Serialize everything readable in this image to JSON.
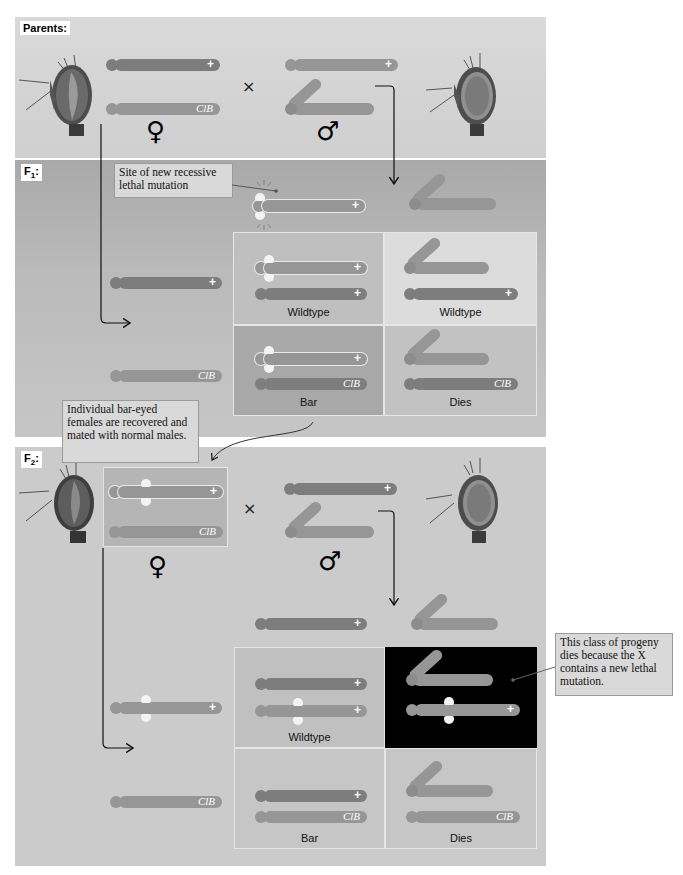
{
  "figure": {
    "colors": {
      "background": "#ffffff",
      "parents_panel": "#d4d4d4",
      "f1_panel": "#b3b3b3",
      "f2_panel": "#cbcbcb",
      "chromosome_dark": "#7d7d7d",
      "chromosome_light": "#969696",
      "dies_cell_background": "#000000",
      "callout_background": "#d9d9d9"
    }
  },
  "parents": {
    "label": "Parents:",
    "cross_symbol": "×",
    "female": {
      "symbol": "♀",
      "chromosomes": [
        {
          "allele_label": "+",
          "shade": "dark"
        },
        {
          "allele_label": "ClB",
          "shade": "light"
        }
      ]
    },
    "male": {
      "symbol": "♂",
      "chromosomes": [
        {
          "allele_label": "+",
          "shade": "light",
          "type": "X"
        },
        {
          "allele_label": "",
          "shade": "light",
          "type": "Y"
        }
      ]
    }
  },
  "f1": {
    "label": "F",
    "label_sub": "1",
    "label_suffix": ":",
    "callout": "Site of new recessive lethal mutation",
    "top_row": {
      "maternal_x": {
        "allele_label": "+",
        "has_mutation": true
      },
      "paternal": "Y"
    },
    "left_column": [
      {
        "allele_label": "+"
      },
      {
        "allele_label": "ClB"
      }
    ],
    "cells": [
      {
        "label": "Wildtype",
        "chromosomes": [
          "+ (mutant)",
          "+"
        ]
      },
      {
        "label": "Wildtype",
        "chromosomes": [
          "Y",
          "+"
        ]
      },
      {
        "label": "Bar",
        "chromosomes": [
          "+ (mutant)",
          "ClB"
        ]
      },
      {
        "label": "Dies",
        "chromosomes": [
          "Y",
          "ClB"
        ]
      }
    ]
  },
  "f1_to_f2_callout": "Individual bar-eyed females are recovered and mated with normal males.",
  "f2": {
    "label": "F",
    "label_sub": "2",
    "label_suffix": ":",
    "cross_symbol": "×",
    "female": {
      "symbol": "♀",
      "chromosomes": [
        {
          "allele_label": "+",
          "has_mutation": true
        },
        {
          "allele_label": "ClB"
        }
      ]
    },
    "male": {
      "symbol": "♂",
      "chromosomes": [
        {
          "allele_label": "+",
          "type": "X"
        },
        {
          "allele_label": "",
          "type": "Y"
        }
      ]
    },
    "top_row": {
      "paternal_x": {
        "allele_label": "+"
      },
      "paternal_y": "Y"
    },
    "left_column": [
      {
        "allele_label": "+",
        "has_mutation": true
      },
      {
        "allele_label": "ClB"
      }
    ],
    "cells": [
      {
        "label": "Wildtype",
        "chromosomes": [
          "+",
          "+ (mutant)"
        ]
      },
      {
        "label": "",
        "chromosomes": [
          "Y",
          "+ (mutant)"
        ],
        "highlight": "black"
      },
      {
        "label": "Bar",
        "chromosomes": [
          "+",
          "ClB"
        ]
      },
      {
        "label": "Dies",
        "chromosomes": [
          "Y",
          "ClB"
        ]
      }
    ],
    "callout": "This class of progeny dies because the X contains a new lethal mutation."
  }
}
